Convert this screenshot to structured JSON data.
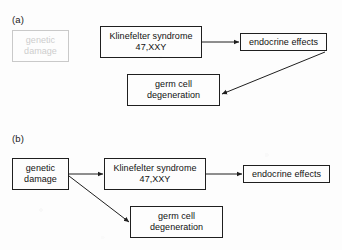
{
  "figure": {
    "width": 342,
    "height": 250,
    "background_color": "#fdfdfd",
    "stroke_color": "#1f1f1f",
    "faded_color": "#cdcdcd",
    "text_color": "#111111"
  },
  "panels": [
    {
      "id": "panel-a",
      "label": "(a)",
      "nodes": [
        {
          "id": "a-genetic-damage",
          "name": "genetic-damage",
          "line1": "genetic",
          "line2": "damage",
          "state": "faded",
          "x": 12,
          "y": 30,
          "w": 57,
          "h": 32
        },
        {
          "id": "a-klinefelter",
          "name": "klinefelter-syndrome",
          "line1": "Klinefelter syndrome",
          "line2": "47,XXY",
          "state": "solid",
          "x": 100,
          "y": 26,
          "w": 102,
          "h": 32
        },
        {
          "id": "a-endocrine-effects",
          "name": "endocrine-effects",
          "line1": "endocrine effects",
          "line2": "",
          "state": "solid",
          "x": 240,
          "y": 33,
          "w": 87,
          "h": 18
        },
        {
          "id": "a-germ-cell",
          "name": "germ-cell-degeneration",
          "line1": "germ cell",
          "line2": "degeneration",
          "state": "solid",
          "x": 127,
          "y": 74,
          "w": 93,
          "h": 32
        }
      ],
      "edges": [
        {
          "id": "a-edge-klinefelter-endocrine",
          "name": "arrow-klinefelter-to-endocrine",
          "from": "klinefelter-syndrome",
          "to": "endocrine-effects",
          "kind": "horizontal"
        },
        {
          "id": "a-edge-endocrine-germcell",
          "name": "arrow-endocrine-to-germ-cell",
          "from": "endocrine-effects",
          "to": "germ-cell-degeneration",
          "kind": "diagonal"
        }
      ]
    },
    {
      "id": "panel-b",
      "label": "(b)",
      "nodes": [
        {
          "id": "b-genetic-damage",
          "name": "genetic-damage",
          "line1": "genetic",
          "line2": "damage",
          "state": "solid",
          "x": 12,
          "y": 158,
          "w": 57,
          "h": 32
        },
        {
          "id": "b-klinefelter",
          "name": "klinefelter-syndrome",
          "line1": "Klinefelter syndrome",
          "line2": "47,XXY",
          "state": "solid",
          "x": 104,
          "y": 158,
          "w": 102,
          "h": 32
        },
        {
          "id": "b-endocrine-effects",
          "name": "endocrine-effects",
          "line1": "endocrine effects",
          "line2": "",
          "state": "solid",
          "x": 243,
          "y": 165,
          "w": 87,
          "h": 18
        },
        {
          "id": "b-germ-cell",
          "name": "germ-cell-degeneration",
          "line1": "germ cell",
          "line2": "degeneration",
          "state": "solid",
          "x": 130,
          "y": 206,
          "w": 93,
          "h": 32
        }
      ],
      "edges": [
        {
          "id": "b-edge-genetic-klinefelter",
          "name": "arrow-genetic-damage-to-klinefelter",
          "from": "genetic-damage",
          "to": "klinefelter-syndrome",
          "kind": "horizontal"
        },
        {
          "id": "b-edge-genetic-germcell",
          "name": "arrow-genetic-damage-to-germ-cell",
          "from": "genetic-damage",
          "to": "germ-cell-degeneration",
          "kind": "diagonal"
        },
        {
          "id": "b-edge-klinefelter-endocrine",
          "name": "arrow-klinefelter-to-endocrine",
          "from": "klinefelter-syndrome",
          "to": "endocrine-effects",
          "kind": "horizontal"
        }
      ]
    }
  ]
}
